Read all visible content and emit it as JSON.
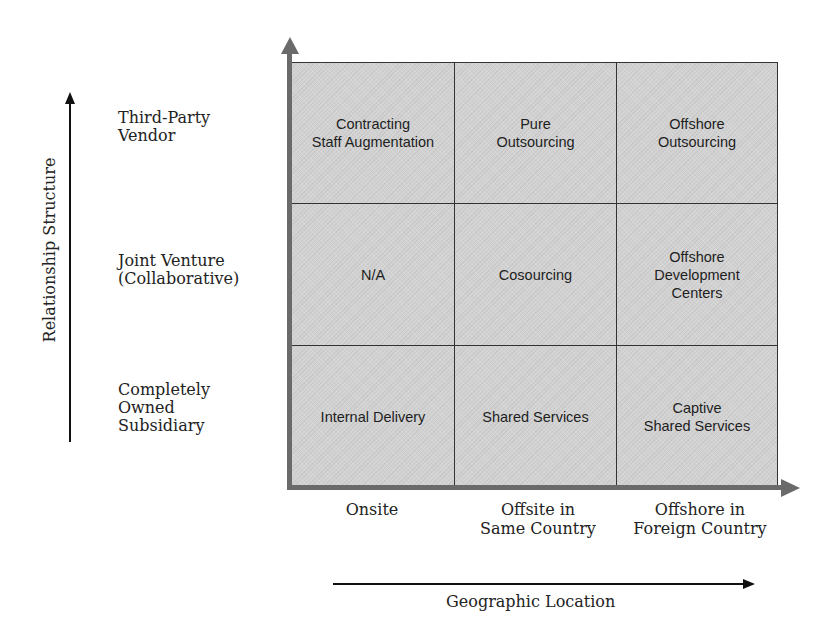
{
  "diagram": {
    "type": "2x-axis matrix",
    "y_axis": {
      "title": "Relationship Structure",
      "levels": [
        "Third-Party\nVendor",
        "Joint Venture\n(Collaborative)",
        "Completely\nOwned\nSubsidiary"
      ]
    },
    "x_axis": {
      "title": "Geographic Location",
      "levels": [
        "Onsite",
        "Offsite in\nSame Country",
        "Offshore in\nForeign Country"
      ]
    },
    "cells": [
      [
        "Contracting\nStaff Augmentation",
        "Pure\nOutsourcing",
        "Offshore\nOutsourcing"
      ],
      [
        "N/A",
        "Cosourcing",
        "Offshore\nDevelopment\nCenters"
      ],
      [
        "Internal Delivery",
        "Shared Services",
        "Captive\nShared Services"
      ]
    ],
    "colors": {
      "cell_fill": "#d2d2d2",
      "axis_gray": "#6a6a6a",
      "grid_line": "#333333",
      "text": "#222222"
    }
  }
}
